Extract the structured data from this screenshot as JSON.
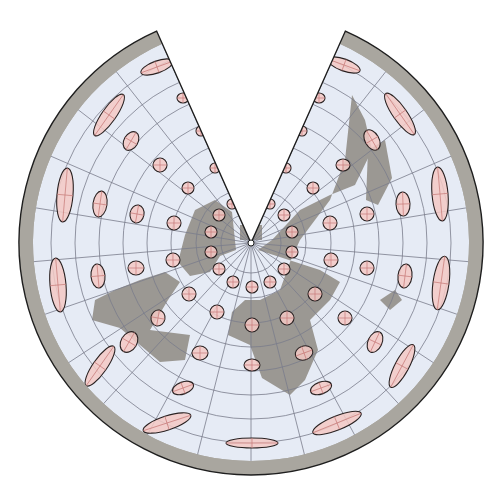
{
  "map": {
    "title": "Conic projection with Tissot indicatrices",
    "projection": "conic",
    "center": [
      251,
      243
    ],
    "radius": 232,
    "wedge_half_angle_deg": 24,
    "colors": {
      "background": "#ffffff",
      "outer_ring": "#a9a69f",
      "ocean": "#e6ebf5",
      "land": "#9b9893",
      "graticule": "#7a7c8c",
      "indicatrix_fill": "#f3c9c4",
      "indicatrix_stroke": "#2a2222",
      "border": "#1e1e1e"
    },
    "graticule": {
      "parallel_radii": [
        30,
        55,
        80,
        104,
        128,
        152,
        176,
        200
      ],
      "meridian_count": 22
    },
    "indicatrices": [
      {
        "x": 157,
        "y": 67,
        "rx": 17,
        "ry": 6,
        "rot": -20
      },
      {
        "x": 183,
        "y": 98,
        "rx": 6,
        "ry": 5,
        "rot": 0
      },
      {
        "x": 109,
        "y": 115,
        "rx": 25,
        "ry": 7,
        "rot": -55
      },
      {
        "x": 201,
        "y": 131,
        "rx": 5,
        "ry": 5,
        "rot": 0
      },
      {
        "x": 131,
        "y": 141,
        "rx": 10,
        "ry": 7,
        "rot": -60
      },
      {
        "x": 160,
        "y": 165,
        "rx": 7,
        "ry": 7,
        "rot": 0
      },
      {
        "x": 215,
        "y": 168,
        "rx": 5,
        "ry": 5,
        "rot": 0
      },
      {
        "x": 65,
        "y": 195,
        "rx": 27,
        "ry": 8,
        "rot": -85
      },
      {
        "x": 100,
        "y": 204,
        "rx": 13,
        "ry": 7,
        "rot": -82
      },
      {
        "x": 137,
        "y": 214,
        "rx": 9,
        "ry": 7,
        "rot": -80
      },
      {
        "x": 174,
        "y": 223,
        "rx": 7,
        "ry": 7,
        "rot": 0
      },
      {
        "x": 188,
        "y": 188,
        "rx": 6,
        "ry": 6,
        "rot": 0
      },
      {
        "x": 219,
        "y": 215,
        "rx": 6,
        "ry": 6,
        "rot": 0
      },
      {
        "x": 211,
        "y": 232,
        "rx": 6,
        "ry": 6,
        "rot": 0
      },
      {
        "x": 232,
        "y": 204,
        "rx": 5,
        "ry": 5,
        "rot": 0
      },
      {
        "x": 211,
        "y": 252,
        "rx": 6,
        "ry": 6,
        "rot": 0
      },
      {
        "x": 219,
        "y": 269,
        "rx": 6,
        "ry": 6,
        "rot": 0
      },
      {
        "x": 233,
        "y": 282,
        "rx": 6,
        "ry": 6,
        "rot": 0
      },
      {
        "x": 252,
        "y": 287,
        "rx": 6,
        "ry": 6,
        "rot": 0
      },
      {
        "x": 270,
        "y": 282,
        "rx": 6,
        "ry": 6,
        "rot": 0
      },
      {
        "x": 284,
        "y": 269,
        "rx": 6,
        "ry": 6,
        "rot": 0
      },
      {
        "x": 292,
        "y": 252,
        "rx": 6,
        "ry": 6,
        "rot": 0
      },
      {
        "x": 292,
        "y": 232,
        "rx": 6,
        "ry": 6,
        "rot": 0
      },
      {
        "x": 284,
        "y": 215,
        "rx": 6,
        "ry": 6,
        "rot": 0
      },
      {
        "x": 270,
        "y": 204,
        "rx": 5,
        "ry": 5,
        "rot": 0
      },
      {
        "x": 58,
        "y": 285,
        "rx": 27,
        "ry": 8,
        "rot": -95
      },
      {
        "x": 98,
        "y": 276,
        "rx": 12,
        "ry": 7,
        "rot": -95
      },
      {
        "x": 136,
        "y": 268,
        "rx": 8,
        "ry": 7,
        "rot": 0
      },
      {
        "x": 173,
        "y": 260,
        "rx": 7,
        "ry": 7,
        "rot": 0
      },
      {
        "x": 189,
        "y": 294,
        "rx": 7,
        "ry": 7,
        "rot": 0
      },
      {
        "x": 217,
        "y": 312,
        "rx": 7,
        "ry": 7,
        "rot": 0
      },
      {
        "x": 158,
        "y": 318,
        "rx": 8,
        "ry": 7,
        "rot": -80
      },
      {
        "x": 129,
        "y": 342,
        "rx": 11,
        "ry": 8,
        "rot": -60
      },
      {
        "x": 100,
        "y": 366,
        "rx": 24,
        "ry": 7,
        "rot": -55
      },
      {
        "x": 200,
        "y": 353,
        "rx": 8,
        "ry": 7,
        "rot": 0
      },
      {
        "x": 183,
        "y": 388,
        "rx": 11,
        "ry": 6,
        "rot": -20
      },
      {
        "x": 167,
        "y": 423,
        "rx": 25,
        "ry": 7,
        "rot": -18
      },
      {
        "x": 252,
        "y": 325,
        "rx": 7,
        "ry": 7,
        "rot": 0
      },
      {
        "x": 252,
        "y": 365,
        "rx": 8,
        "ry": 6,
        "rot": 0
      },
      {
        "x": 252,
        "y": 443,
        "rx": 26,
        "ry": 5,
        "rot": 0
      },
      {
        "x": 287,
        "y": 318,
        "rx": 7,
        "ry": 7,
        "rot": 0
      },
      {
        "x": 315,
        "y": 294,
        "rx": 7,
        "ry": 7,
        "rot": 0
      },
      {
        "x": 304,
        "y": 353,
        "rx": 9,
        "ry": 7,
        "rot": -20
      },
      {
        "x": 321,
        "y": 388,
        "rx": 11,
        "ry": 6,
        "rot": -20
      },
      {
        "x": 337,
        "y": 423,
        "rx": 26,
        "ry": 7,
        "rot": -22
      },
      {
        "x": 345,
        "y": 318,
        "rx": 7,
        "ry": 7,
        "rot": 0
      },
      {
        "x": 375,
        "y": 342,
        "rx": 11,
        "ry": 7,
        "rot": -65
      },
      {
        "x": 402,
        "y": 366,
        "rx": 24,
        "ry": 7,
        "rot": -62
      },
      {
        "x": 331,
        "y": 260,
        "rx": 7,
        "ry": 7,
        "rot": 0
      },
      {
        "x": 367,
        "y": 268,
        "rx": 7,
        "ry": 7,
        "rot": 0
      },
      {
        "x": 405,
        "y": 276,
        "rx": 12,
        "ry": 7,
        "rot": -83
      },
      {
        "x": 441,
        "y": 283,
        "rx": 27,
        "ry": 8,
        "rot": -82
      },
      {
        "x": 330,
        "y": 223,
        "rx": 7,
        "ry": 7,
        "rot": 0
      },
      {
        "x": 367,
        "y": 214,
        "rx": 7,
        "ry": 7,
        "rot": 0
      },
      {
        "x": 403,
        "y": 204,
        "rx": 12,
        "ry": 7,
        "rot": -92
      },
      {
        "x": 440,
        "y": 194,
        "rx": 27,
        "ry": 8,
        "rot": -95
      },
      {
        "x": 313,
        "y": 188,
        "rx": 6,
        "ry": 6,
        "rot": 0
      },
      {
        "x": 343,
        "y": 165,
        "rx": 7,
        "ry": 6,
        "rot": 0
      },
      {
        "x": 372,
        "y": 140,
        "rx": 11,
        "ry": 7,
        "rot": -120
      },
      {
        "x": 400,
        "y": 114,
        "rx": 25,
        "ry": 7,
        "rot": -125
      },
      {
        "x": 286,
        "y": 168,
        "rx": 5,
        "ry": 5,
        "rot": 0
      },
      {
        "x": 302,
        "y": 131,
        "rx": 5,
        "ry": 5,
        "rot": 0
      },
      {
        "x": 319,
        "y": 98,
        "rx": 6,
        "ry": 5,
        "rot": 0
      },
      {
        "x": 344,
        "y": 65,
        "rx": 17,
        "ry": 6,
        "rot": 20
      }
    ]
  }
}
